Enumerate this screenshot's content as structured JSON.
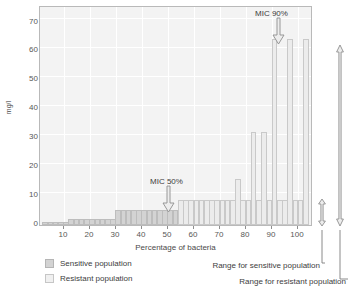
{
  "chart_data": {
    "type": "bar",
    "title": "",
    "xlabel": "Percentage of bacteria",
    "ylabel": "mg/l",
    "xlim": [
      0,
      104
    ],
    "ylim": [
      0,
      75
    ],
    "yticks": [
      0,
      10,
      20,
      30,
      40,
      50,
      60,
      70
    ],
    "xticks": [
      10,
      20,
      30,
      40,
      50,
      60,
      70,
      80,
      90,
      100
    ],
    "grid": true,
    "legend_position": "below-left",
    "series": [
      {
        "name": "Sensitive population",
        "color": "#d3d3d3",
        "x": [
          2,
          4,
          6,
          8,
          10,
          12,
          14,
          16,
          18,
          20,
          22,
          24,
          26,
          28,
          30,
          32,
          34,
          36,
          38,
          40,
          42,
          44,
          46,
          48,
          50,
          52
        ],
        "values": [
          1,
          1,
          1,
          1,
          1,
          2,
          2,
          2,
          2,
          2,
          2,
          2,
          2,
          2,
          5,
          5,
          5,
          5,
          5,
          5,
          5,
          5,
          5,
          5,
          5,
          5
        ]
      },
      {
        "name": "Resistant population",
        "color": "#ececec",
        "x": [
          54,
          56,
          58,
          60,
          62,
          64,
          66,
          68,
          70,
          72,
          74,
          76,
          78,
          80,
          82,
          84,
          86,
          88,
          90,
          92,
          94,
          96,
          98,
          100,
          102
        ],
        "values": [
          8.5,
          8.5,
          8.5,
          8.5,
          8.5,
          8.5,
          8.5,
          8.5,
          8.5,
          8.5,
          8.5,
          16,
          8.5,
          8.5,
          32,
          8.5,
          32,
          8.5,
          64,
          8.5,
          8.5,
          64,
          8.5,
          8.5,
          64
        ]
      }
    ],
    "annotations": [
      {
        "label": "MIC 50%",
        "x": 51,
        "y": 5,
        "arrow": "down"
      },
      {
        "label": "MIC 90%",
        "x": 90,
        "y": 64,
        "arrow": "down"
      }
    ],
    "range_markers": [
      {
        "label": "Range for sensitive population",
        "from": 0,
        "to": 9
      },
      {
        "label": "Range for resistant population",
        "from": 0,
        "to": 65
      }
    ]
  },
  "axes": {
    "ylabel": "mg/l",
    "xlabel": "Percentage of bacteria",
    "yticks": [
      "70",
      "60",
      "50",
      "40",
      "30",
      "20",
      "10",
      "0"
    ],
    "xticks": [
      "10",
      "20",
      "30",
      "40",
      "50",
      "60",
      "70",
      "80",
      "90",
      "100"
    ]
  },
  "annotations": {
    "mic50": "MIC 50%",
    "mic90": "MIC 90%"
  },
  "legend": {
    "sensitive": "Sensitive population",
    "resistant": "Resistant population",
    "range_sensitive": "Range for sensitive population",
    "range_resistant": "Range for resistant population"
  },
  "colors": {
    "plot_background": "#f3f3f3",
    "gridline": "#ffffff",
    "sensitive_bar": "#d3d3d3",
    "resistant_bar": "#ececec",
    "border": "#b9b9b9",
    "text": "#3d3d3d",
    "arrow": "#9a9a9a"
  }
}
